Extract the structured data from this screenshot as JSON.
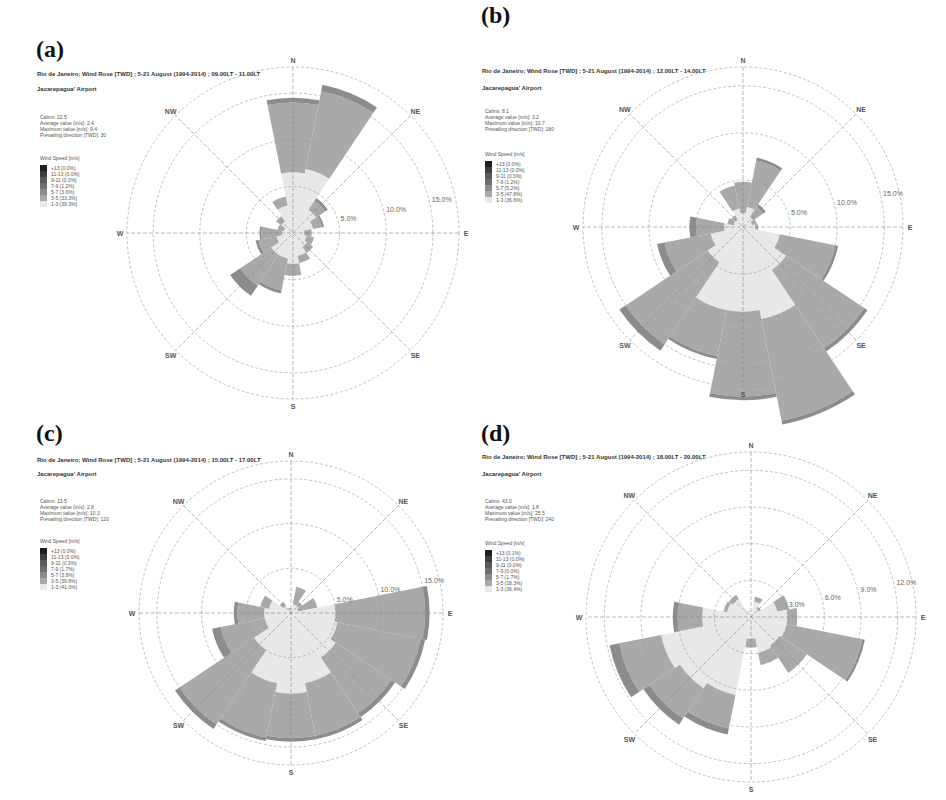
{
  "figure": {
    "band_colors": [
      "#e8e8e8",
      "#a9a9a9",
      "#8c8c8c",
      "#6e6e6e",
      "#5a5a5a",
      "#3e3e3e",
      "#1e1e1e"
    ],
    "directions": [
      "N",
      "NE",
      "E",
      "SE",
      "S",
      "SW",
      "W",
      "NW"
    ]
  },
  "chart_data": [
    {
      "type": "wind-rose",
      "panel_label": "(a)",
      "title": "Rio de Janeiro; Wind Rose [TWD] ; 5-21 August (1994-2014) ; 09.00LT - 11.00LT",
      "subtitle": "Jacarepagua' Airport",
      "stats": [
        "Calms: 22.5",
        "Average value [m/s]: 2.4",
        "Maximum value [m/s]: 9.4",
        "Prevailing direction [TWD]: 30"
      ],
      "legend_title": "Wind Speed [m/s]",
      "legend": [
        "+13 (0.0%)",
        "11-13 (0.0%)",
        "9-11 (0.3%)",
        "7-9 (1.2%)",
        "5-7 (3.6%)",
        "3-5 (33.3%)",
        "1-3 (39.3%)"
      ],
      "rings": [
        5,
        10,
        15
      ],
      "ring_labels": [
        "5.0%",
        "10.0%",
        "15.0%"
      ],
      "sectors_deg": [
        0,
        22.5,
        45,
        67.5,
        90,
        112.5,
        135,
        157.5,
        180,
        202.5,
        225,
        247.5,
        270,
        292.5,
        315,
        337.5
      ],
      "bands": [
        "1-3",
        "3-5",
        "5-7",
        "7-9",
        "9-11",
        "11-13",
        "+13"
      ],
      "values": [
        [
          6.5,
          7.5,
          0.5,
          0,
          0,
          0,
          0
        ],
        [
          7.0,
          8.5,
          0.7,
          0,
          0,
          0,
          0
        ],
        [
          3.0,
          1.2,
          0.3,
          0,
          0,
          0,
          0
        ],
        [
          2.2,
          1.0,
          0.2,
          0,
          0,
          0,
          0
        ],
        [
          1.2,
          0.8,
          0,
          0,
          0,
          0,
          0
        ],
        [
          1.5,
          0.8,
          0,
          0,
          0,
          0,
          0
        ],
        [
          1.8,
          0.8,
          0,
          0,
          0,
          0,
          0
        ],
        [
          2.5,
          0.8,
          0,
          0,
          0,
          0,
          0
        ],
        [
          3.3,
          1.3,
          0,
          0,
          0,
          0,
          0
        ],
        [
          2.8,
          3.5,
          0.3,
          0,
          0,
          0,
          0
        ],
        [
          2.8,
          4.0,
          1.3,
          0,
          0,
          0,
          0
        ],
        [
          1.8,
          2.0,
          0.3,
          0,
          0,
          0,
          0
        ],
        [
          1.2,
          2.2,
          0.2,
          0,
          0,
          0,
          0
        ],
        [
          1.0,
          0.7,
          0,
          0,
          0,
          0,
          0
        ],
        [
          1.5,
          0.7,
          0,
          0,
          0,
          0,
          0
        ],
        [
          3.0,
          1.0,
          0,
          0,
          0,
          0,
          0
        ]
      ],
      "scale_max": 17.8
    },
    {
      "type": "wind-rose",
      "panel_label": "(b)",
      "title": "Rio de Janeiro; Wind Rose [TWD] ; 5-21 August (1994-2014) ; 12.00LT - 14.00LT",
      "subtitle": "Jacarepagua' Airport",
      "stats": [
        "Calms: 8.1",
        "Average value [m/s]: 3.2",
        "Maximum value [m/s]: 10.7",
        "Prevailing direction [TWD]: 180"
      ],
      "legend_title": "Wind Speed [m/s]",
      "legend": [
        "+13 (0.0%)",
        "11-13 (0.0%)",
        "9-11 (0.3%)",
        "7-9 (1.2%)",
        "5-7 (5.2%)",
        "3-5 (47.8%)",
        "1-3 (36.6%)"
      ],
      "rings": [
        5,
        10,
        15
      ],
      "ring_labels": [
        "5.0%",
        "10.0%",
        "15.0%"
      ],
      "sectors_deg": [
        0,
        22.5,
        45,
        67.5,
        90,
        112.5,
        135,
        157.5,
        180,
        202.5,
        225,
        247.5,
        270,
        292.5,
        315,
        337.5
      ],
      "bands": [
        "1-3",
        "3-5",
        "5-7",
        "7-9",
        "9-11",
        "11-13",
        "+13"
      ],
      "values": [
        [
          1.5,
          3.3,
          0,
          0,
          0,
          0,
          0
        ],
        [
          2.2,
          5.0,
          0.3,
          0,
          0,
          0,
          0
        ],
        [
          1.3,
          1.3,
          0.3,
          0,
          0,
          0,
          0
        ],
        [
          1.0,
          0.5,
          0,
          0,
          0,
          0,
          0
        ],
        [
          1.3,
          0.3,
          0,
          0,
          0,
          0,
          0
        ],
        [
          4.0,
          6.0,
          0.3,
          0,
          0,
          0,
          0
        ],
        [
          5.5,
          10.0,
          0.4,
          0,
          0,
          0,
          0
        ],
        [
          10.0,
          11.0,
          0.4,
          0,
          0,
          0,
          0
        ],
        [
          9.0,
          9.0,
          0.4,
          0,
          0,
          0,
          0
        ],
        [
          9.0,
          5.0,
          0.3,
          0,
          0,
          0,
          0
        ],
        [
          4.5,
          10.5,
          0.8,
          0,
          0,
          0,
          0
        ],
        [
          3.5,
          5.0,
          0.8,
          0,
          0,
          0,
          0
        ],
        [
          2.0,
          3.0,
          0.7,
          0,
          0,
          0,
          0
        ],
        [
          1.0,
          0.7,
          0,
          0,
          0,
          0,
          0
        ],
        [
          1.0,
          0.5,
          0,
          0,
          0,
          0,
          0
        ],
        [
          2.0,
          2.5,
          0,
          0,
          0,
          0,
          0
        ]
      ],
      "scale_max": 17.0
    },
    {
      "type": "wind-rose",
      "panel_label": "(c)",
      "title": "Rio de Janeiro; Wind Rose [TWD] ; 5-21 August (1994-2014) ; 15.00LT - 17.00LT",
      "subtitle": "Jacarepagua' Airport",
      "stats": [
        "Calms: 13.5",
        "Average value [m/s]: 2.8",
        "Maximum value [m/s]: 10.3",
        "Prevailing direction [TWD]: 120"
      ],
      "legend_title": "Wind Speed [m/s]",
      "legend": [
        "+13 (0.0%)",
        "11-13 (0.0%)",
        "9-11 (0.3%)",
        "7-9 (1.7%)",
        "5-7 (3.8%)",
        "3-5 (39.8%)",
        "1-3 (41.0%)"
      ],
      "rings": [
        5,
        10,
        15
      ],
      "ring_labels": [
        "5.0%",
        "10.0%",
        "15.0%"
      ],
      "sectors_deg": [
        0,
        22.5,
        45,
        67.5,
        90,
        112.5,
        135,
        157.5,
        180,
        202.5,
        225,
        247.5,
        270,
        292.5,
        315,
        337.5
      ],
      "bands": [
        "1-3",
        "3-5",
        "5-7",
        "7-9",
        "9-11",
        "11-13",
        "+13"
      ],
      "values": [
        [
          0.3,
          0.2,
          0,
          0,
          0,
          0,
          0
        ],
        [
          1.0,
          2.0,
          0,
          0,
          0,
          0,
          0
        ],
        [
          1.0,
          0.5,
          0,
          0,
          0,
          0,
          0
        ],
        [
          0.8,
          2.2,
          0,
          0,
          0,
          0,
          0
        ],
        [
          5.0,
          10.0,
          0.5,
          0,
          0,
          0,
          0
        ],
        [
          5.3,
          9.5,
          0.5,
          0,
          0,
          0,
          0
        ],
        [
          6.0,
          7.5,
          0.5,
          0,
          0,
          0,
          0
        ],
        [
          8.0,
          6.0,
          0.4,
          0,
          0,
          0,
          0
        ],
        [
          9.0,
          5.0,
          0.4,
          0,
          0,
          0,
          0
        ],
        [
          8.0,
          6.2,
          0.4,
          0,
          0,
          0,
          0
        ],
        [
          5.0,
          10.0,
          0.6,
          0,
          0,
          0,
          0
        ],
        [
          3.0,
          5.0,
          1.0,
          0,
          0,
          0,
          0
        ],
        [
          3.0,
          3.0,
          0.4,
          0,
          0,
          0,
          0
        ],
        [
          2.5,
          1.0,
          0,
          0,
          0,
          0,
          0
        ],
        [
          1.0,
          0.5,
          0,
          0,
          0,
          0,
          0
        ],
        [
          0.3,
          0.3,
          0,
          0,
          0,
          0,
          0
        ]
      ],
      "scale_max": 17.0
    },
    {
      "type": "wind-rose",
      "panel_label": "(d)",
      "title": "Rio de Janeiro; Wind Rose [TWD] ; 5-21 August (1994-2014) ; 18.00LT - 20.00LT",
      "subtitle": "Jacarepagua' Airport",
      "stats": [
        "Calms: 43.0",
        "Average value [m/s]: 1.8",
        "Maximum value [m/s]: 25.5",
        "Prevailing direction [TWD]: 240"
      ],
      "legend_title": "Wind Speed [m/s]",
      "legend": [
        "+13 (0.1%)",
        "11-13 (0.0%)",
        "9-11 (0.0%)",
        "7-9 (0.0%)",
        "5-7 (1.7%)",
        "3-5 (18.3%)",
        "1-3 (36.4%)"
      ],
      "rings": [
        3,
        6,
        9,
        12
      ],
      "ring_labels": [
        "3.0%",
        "6.0%",
        "9.0%",
        "12.0%"
      ],
      "sectors_deg": [
        0,
        22.5,
        45,
        67.5,
        90,
        112.5,
        135,
        157.5,
        180,
        202.5,
        225,
        247.5,
        270,
        292.5,
        315,
        337.5
      ],
      "bands": [
        "1-3",
        "3-5",
        "5-7",
        "7-9",
        "9-11",
        "11-13",
        "+13"
      ],
      "values": [
        [
          0.5,
          0,
          0,
          0,
          0,
          0,
          0
        ],
        [
          1.3,
          0.4,
          0,
          0,
          0,
          0,
          0
        ],
        [
          0.8,
          0.2,
          0,
          0,
          0,
          0,
          0
        ],
        [
          2.2,
          1.0,
          0,
          0,
          0,
          0,
          0
        ],
        [
          3.0,
          0.8,
          0,
          0,
          0,
          0,
          0
        ],
        [
          3.0,
          6.3,
          0.2,
          0,
          0,
          0,
          0
        ],
        [
          2.8,
          2.7,
          0,
          0,
          0,
          0,
          0
        ],
        [
          3.0,
          1.0,
          0,
          0,
          0,
          0,
          0
        ],
        [
          1.8,
          0.7,
          0,
          0,
          0,
          0,
          0
        ],
        [
          6.5,
          2.8,
          0.5,
          0,
          0,
          0,
          0
        ],
        [
          7.0,
          3.0,
          0.6,
          0,
          0,
          0,
          0
        ],
        [
          7.5,
          3.5,
          0.8,
          0,
          0,
          0,
          0
        ],
        [
          4.0,
          2.0,
          0.4,
          0,
          0,
          0,
          0
        ],
        [
          2.0,
          0.3,
          0,
          0,
          0,
          0,
          0
        ],
        [
          1.8,
          0.4,
          0,
          0,
          0,
          0,
          0
        ],
        [
          0.6,
          0,
          0,
          0,
          0,
          0,
          0
        ]
      ],
      "scale_max": 13.5
    }
  ]
}
